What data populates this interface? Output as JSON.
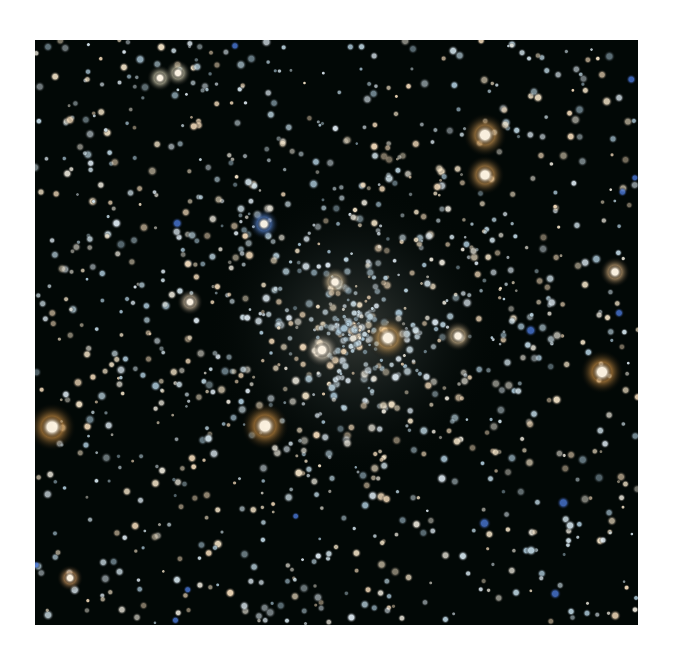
{
  "image": {
    "subject": "globular star cluster",
    "frame": {
      "x": 35,
      "y": 40,
      "width": 603,
      "height": 585
    },
    "background_color": "#020806",
    "page_color": "#ffffff",
    "core_center": {
      "x": 355,
      "y": 330
    },
    "core_radius": 150,
    "bright_stars": [
      {
        "x": 485,
        "y": 135,
        "color": "#f0b060",
        "r": 10
      },
      {
        "x": 485,
        "y": 175,
        "color": "#f0b060",
        "r": 9
      },
      {
        "x": 388,
        "y": 338,
        "color": "#f2b868",
        "r": 10
      },
      {
        "x": 602,
        "y": 372,
        "color": "#f0a850",
        "r": 10
      },
      {
        "x": 52,
        "y": 427,
        "color": "#f0a850",
        "r": 11
      },
      {
        "x": 265,
        "y": 426,
        "color": "#f0a850",
        "r": 11
      },
      {
        "x": 335,
        "y": 282,
        "color": "#f8dcb0",
        "r": 7
      },
      {
        "x": 322,
        "y": 350,
        "color": "#fff0d8",
        "r": 8
      },
      {
        "x": 615,
        "y": 272,
        "color": "#f5c890",
        "r": 7
      },
      {
        "x": 458,
        "y": 336,
        "color": "#f8d8a8",
        "r": 7
      },
      {
        "x": 264,
        "y": 224,
        "color": "#6aa0ff",
        "r": 7
      },
      {
        "x": 178,
        "y": 73,
        "color": "#f8f0d0",
        "r": 6
      },
      {
        "x": 160,
        "y": 78,
        "color": "#f8f0d0",
        "r": 6
      },
      {
        "x": 70,
        "y": 578,
        "color": "#f0b070",
        "r": 6
      },
      {
        "x": 190,
        "y": 302,
        "color": "#f8e0c0",
        "r": 6
      }
    ],
    "field_star_count": 1400
  }
}
